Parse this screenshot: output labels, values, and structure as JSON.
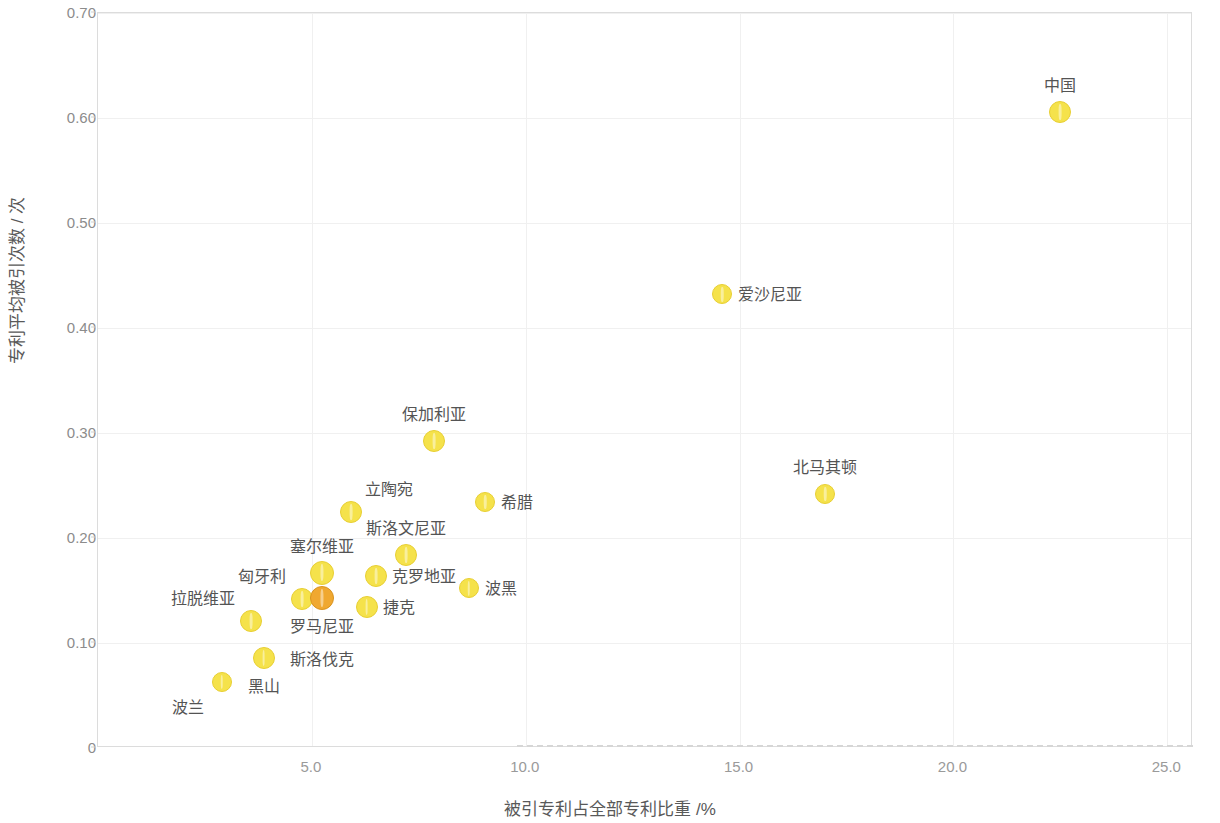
{
  "chart_data": {
    "type": "scatter",
    "title": "",
    "xlabel": "被引专利占全部专利比重 /%",
    "ylabel": "专利平均被引次数 / 次",
    "xlim": [
      0,
      25.6
    ],
    "ylim": [
      0,
      0.7
    ],
    "xticks": [
      5.0,
      10.0,
      15.0,
      20.0,
      25.0
    ],
    "xtick_labels": [
      "5.0",
      "10.0",
      "15.0",
      "20.0",
      "25.0"
    ],
    "yticks": [
      0,
      0.1,
      0.2,
      0.3,
      0.4,
      0.5,
      0.6,
      0.7
    ],
    "ytick_labels": [
      "0",
      "0.10",
      "0.20",
      "0.30",
      "0.40",
      "0.50",
      "0.60",
      "0.70"
    ],
    "grid": true,
    "legend": "none",
    "marker_color": "#F5E24B",
    "marker_color_overlap": "#F0A830",
    "points": [
      {
        "label": "中国",
        "x": 22.5,
        "y": 0.606,
        "r": 11,
        "color": "#F5E24B",
        "label_pos": "above"
      },
      {
        "label": "爱沙尼亚",
        "x": 14.6,
        "y": 0.432,
        "r": 10,
        "color": "#F5E24B",
        "label_pos": "right"
      },
      {
        "label": "北马其顿",
        "x": 17.0,
        "y": 0.242,
        "r": 10,
        "color": "#F5E24B",
        "label_pos": "above"
      },
      {
        "label": "保加利亚",
        "x": 7.85,
        "y": 0.292,
        "r": 11,
        "color": "#F5E24B",
        "label_pos": "above"
      },
      {
        "label": "希腊",
        "x": 9.05,
        "y": 0.234,
        "r": 10,
        "color": "#F5E24B",
        "label_pos": "right"
      },
      {
        "label": "立陶宛",
        "x": 5.92,
        "y": 0.225,
        "r": 11,
        "color": "#F5E24B",
        "label_pos": "upper-right"
      },
      {
        "label": "斯洛文尼亚",
        "x": 7.2,
        "y": 0.184,
        "r": 11,
        "color": "#F5E24B",
        "label_pos": "above"
      },
      {
        "label": "克罗地亚",
        "x": 6.51,
        "y": 0.164,
        "r": 11,
        "color": "#F5E24B",
        "label_pos": "right"
      },
      {
        "label": "波黑",
        "x": 8.67,
        "y": 0.152,
        "r": 10,
        "color": "#F5E24B",
        "label_pos": "right"
      },
      {
        "label": "塞尔维亚",
        "x": 5.24,
        "y": 0.167,
        "r": 12,
        "color": "#F5E24B",
        "label_pos": "above"
      },
      {
        "label": "匈牙利",
        "x": 4.77,
        "y": 0.142,
        "r": 11,
        "color": "#F5E24B",
        "label_pos": "upper-left"
      },
      {
        "label": "罗马尼亚",
        "x": 5.24,
        "y": 0.143,
        "r": 12,
        "color": "#F0A830",
        "label_pos": "below"
      },
      {
        "label": "斯洛伐克",
        "x": 5.24,
        "y": 0.143,
        "r": 0,
        "color": "#F0A830",
        "label_pos": "below2"
      },
      {
        "label": "捷克",
        "x": 6.28,
        "y": 0.134,
        "r": 11,
        "color": "#F5E24B",
        "label_pos": "right"
      },
      {
        "label": "拉脱维亚",
        "x": 3.58,
        "y": 0.121,
        "r": 11,
        "color": "#F5E24B",
        "label_pos": "upper-left"
      },
      {
        "label": "黑山",
        "x": 3.87,
        "y": 0.086,
        "r": 11,
        "color": "#F5E24B",
        "label_pos": "below"
      },
      {
        "label": "波兰",
        "x": 2.89,
        "y": 0.063,
        "r": 10,
        "color": "#F5E24B",
        "label_pos": "below-left"
      }
    ]
  }
}
